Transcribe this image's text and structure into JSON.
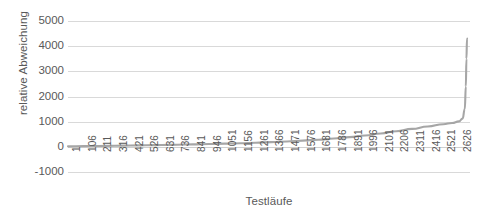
{
  "chart_data": {
    "type": "line",
    "title": "",
    "subtitle": "",
    "xlabel": "Testläufe",
    "ylabel": "relative Abweichung",
    "xlim": [
      1,
      2700
    ],
    "ylim": [
      -1000,
      5000
    ],
    "grid": true,
    "legend": false,
    "legend_position": "none",
    "y_ticks": [
      5000,
      4000,
      3000,
      2000,
      1000,
      0,
      -1000
    ],
    "y_tick_labels": [
      "5000",
      "4000",
      "3000",
      "2000",
      "1000",
      "0",
      "-1000"
    ],
    "x_tick_labels": [
      "1",
      "106",
      "211",
      "316",
      "421",
      "526",
      "631",
      "736",
      "841",
      "946",
      "1051",
      "1156",
      "1261",
      "1366",
      "1471",
      "1576",
      "1681",
      "1786",
      "1891",
      "1996",
      "2101",
      "2206",
      "2311",
      "2416",
      "2521",
      "2626"
    ],
    "x_tick_step": 105,
    "series": [
      {
        "name": "relative Abweichung",
        "color": "#a6a6a6",
        "x": [
          1,
          106,
          211,
          316,
          421,
          526,
          631,
          736,
          841,
          946,
          1051,
          1156,
          1261,
          1366,
          1471,
          1576,
          1681,
          1786,
          1891,
          1996,
          2101,
          2206,
          2311,
          2416,
          2521,
          2580,
          2626,
          2650,
          2665,
          2672,
          2676,
          2680
        ],
        "values": [
          20,
          28,
          36,
          44,
          52,
          62,
          72,
          84,
          96,
          110,
          126,
          144,
          164,
          188,
          214,
          246,
          284,
          330,
          386,
          452,
          530,
          620,
          712,
          810,
          900,
          950,
          1010,
          1120,
          1500,
          2400,
          3500,
          4300
        ]
      }
    ]
  },
  "axes": {
    "y_title": "relative Abweichung",
    "x_title": "Testläufe"
  }
}
